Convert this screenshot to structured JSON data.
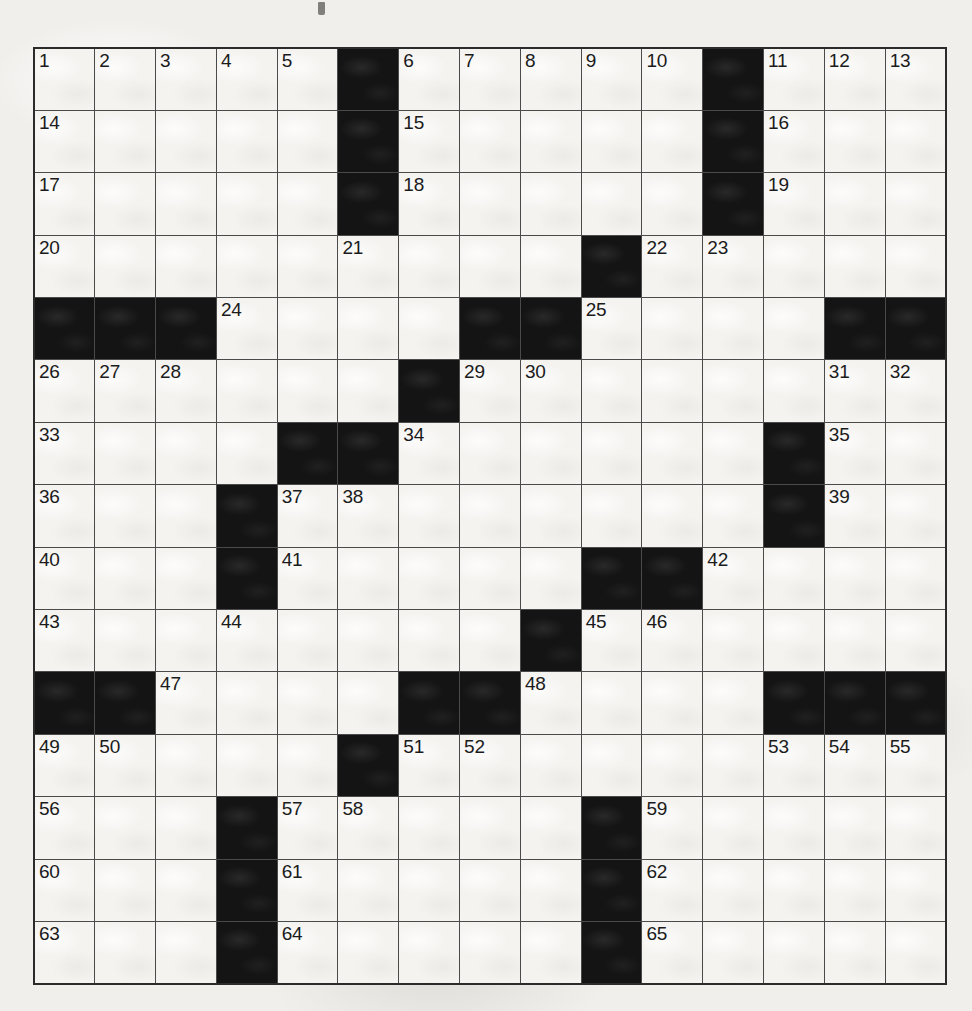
{
  "puzzle": {
    "name": "crossword-grid",
    "rows": 15,
    "columns": 15,
    "colors": {
      "block": "#141414",
      "cell": "#f4f3f0",
      "gridline": "#4a4a4a",
      "border": "#2b2b2b",
      "number_text": "#1b1b1b",
      "paper": "#f0efec"
    },
    "numbers_present": [
      "1",
      "2",
      "3",
      "4",
      "5",
      "6",
      "7",
      "8",
      "9",
      "10",
      "11",
      "12",
      "13",
      "14",
      "15",
      "16",
      "17",
      "18",
      "19",
      "20",
      "21",
      "22",
      "23",
      "24",
      "25",
      "26",
      "27",
      "28",
      "29",
      "30",
      "31",
      "32",
      "33",
      "34",
      "35",
      "36",
      "37",
      "38",
      "39",
      "40",
      "41",
      "42",
      "43",
      "44",
      "45",
      "46",
      "47",
      "48",
      "49",
      "50",
      "51",
      "52",
      "53",
      "54",
      "55",
      "56",
      "57",
      "58",
      "59",
      "60",
      "61",
      "62",
      "63",
      "64",
      "65"
    ],
    "highest_number": 65,
    "grid": [
      [
        {
          "type": "white",
          "number": "1"
        },
        {
          "type": "white",
          "number": "2"
        },
        {
          "type": "white",
          "number": "3"
        },
        {
          "type": "white",
          "number": "4"
        },
        {
          "type": "white",
          "number": "5"
        },
        {
          "type": "black",
          "number": null
        },
        {
          "type": "white",
          "number": "6"
        },
        {
          "type": "white",
          "number": "7"
        },
        {
          "type": "white",
          "number": "8"
        },
        {
          "type": "white",
          "number": "9"
        },
        {
          "type": "white",
          "number": "10"
        },
        {
          "type": "black",
          "number": null
        },
        {
          "type": "white",
          "number": "11"
        },
        {
          "type": "white",
          "number": "12"
        },
        {
          "type": "white",
          "number": "13"
        }
      ],
      [
        {
          "type": "white",
          "number": "14"
        },
        {
          "type": "white",
          "number": null
        },
        {
          "type": "white",
          "number": null
        },
        {
          "type": "white",
          "number": null
        },
        {
          "type": "white",
          "number": null
        },
        {
          "type": "black",
          "number": null
        },
        {
          "type": "white",
          "number": "15"
        },
        {
          "type": "white",
          "number": null
        },
        {
          "type": "white",
          "number": null
        },
        {
          "type": "white",
          "number": null
        },
        {
          "type": "white",
          "number": null
        },
        {
          "type": "black",
          "number": null
        },
        {
          "type": "white",
          "number": "16"
        },
        {
          "type": "white",
          "number": null
        },
        {
          "type": "white",
          "number": null
        }
      ],
      [
        {
          "type": "white",
          "number": "17"
        },
        {
          "type": "white",
          "number": null
        },
        {
          "type": "white",
          "number": null
        },
        {
          "type": "white",
          "number": null
        },
        {
          "type": "white",
          "number": null
        },
        {
          "type": "black",
          "number": null
        },
        {
          "type": "white",
          "number": "18"
        },
        {
          "type": "white",
          "number": null
        },
        {
          "type": "white",
          "number": null
        },
        {
          "type": "white",
          "number": null
        },
        {
          "type": "white",
          "number": null
        },
        {
          "type": "black",
          "number": null
        },
        {
          "type": "white",
          "number": "19"
        },
        {
          "type": "white",
          "number": null
        },
        {
          "type": "white",
          "number": null
        }
      ],
      [
        {
          "type": "white",
          "number": "20"
        },
        {
          "type": "white",
          "number": null
        },
        {
          "type": "white",
          "number": null
        },
        {
          "type": "white",
          "number": null
        },
        {
          "type": "white",
          "number": null
        },
        {
          "type": "white",
          "number": "21"
        },
        {
          "type": "white",
          "number": null
        },
        {
          "type": "white",
          "number": null
        },
        {
          "type": "white",
          "number": null
        },
        {
          "type": "black",
          "number": null
        },
        {
          "type": "white",
          "number": "22"
        },
        {
          "type": "white",
          "number": "23"
        },
        {
          "type": "white",
          "number": null
        },
        {
          "type": "white",
          "number": null
        },
        {
          "type": "white",
          "number": null
        }
      ],
      [
        {
          "type": "black",
          "number": null
        },
        {
          "type": "black",
          "number": null
        },
        {
          "type": "black",
          "number": null
        },
        {
          "type": "white",
          "number": "24"
        },
        {
          "type": "white",
          "number": null
        },
        {
          "type": "white",
          "number": null
        },
        {
          "type": "white",
          "number": null
        },
        {
          "type": "black",
          "number": null
        },
        {
          "type": "black",
          "number": null
        },
        {
          "type": "white",
          "number": "25"
        },
        {
          "type": "white",
          "number": null
        },
        {
          "type": "white",
          "number": null
        },
        {
          "type": "white",
          "number": null
        },
        {
          "type": "black",
          "number": null
        },
        {
          "type": "black",
          "number": null
        }
      ],
      [
        {
          "type": "white",
          "number": "26"
        },
        {
          "type": "white",
          "number": "27"
        },
        {
          "type": "white",
          "number": "28"
        },
        {
          "type": "white",
          "number": null
        },
        {
          "type": "white",
          "number": null
        },
        {
          "type": "white",
          "number": null
        },
        {
          "type": "black",
          "number": null
        },
        {
          "type": "white",
          "number": "29"
        },
        {
          "type": "white",
          "number": "30"
        },
        {
          "type": "white",
          "number": null
        },
        {
          "type": "white",
          "number": null
        },
        {
          "type": "white",
          "number": null
        },
        {
          "type": "white",
          "number": null
        },
        {
          "type": "white",
          "number": "31"
        },
        {
          "type": "white",
          "number": "32"
        }
      ],
      [
        {
          "type": "white",
          "number": "33"
        },
        {
          "type": "white",
          "number": null
        },
        {
          "type": "white",
          "number": null
        },
        {
          "type": "white",
          "number": null
        },
        {
          "type": "black",
          "number": null
        },
        {
          "type": "black",
          "number": null
        },
        {
          "type": "white",
          "number": "34"
        },
        {
          "type": "white",
          "number": null
        },
        {
          "type": "white",
          "number": null
        },
        {
          "type": "white",
          "number": null
        },
        {
          "type": "white",
          "number": null
        },
        {
          "type": "white",
          "number": null
        },
        {
          "type": "black",
          "number": null
        },
        {
          "type": "white",
          "number": "35"
        },
        {
          "type": "white",
          "number": null
        }
      ],
      [
        {
          "type": "white",
          "number": "36"
        },
        {
          "type": "white",
          "number": null
        },
        {
          "type": "white",
          "number": null
        },
        {
          "type": "black",
          "number": null
        },
        {
          "type": "white",
          "number": "37"
        },
        {
          "type": "white",
          "number": "38"
        },
        {
          "type": "white",
          "number": null
        },
        {
          "type": "white",
          "number": null
        },
        {
          "type": "white",
          "number": null
        },
        {
          "type": "white",
          "number": null
        },
        {
          "type": "white",
          "number": null
        },
        {
          "type": "white",
          "number": null
        },
        {
          "type": "black",
          "number": null
        },
        {
          "type": "white",
          "number": "39"
        },
        {
          "type": "white",
          "number": null
        }
      ],
      [
        {
          "type": "white",
          "number": "40"
        },
        {
          "type": "white",
          "number": null
        },
        {
          "type": "white",
          "number": null
        },
        {
          "type": "black",
          "number": null
        },
        {
          "type": "white",
          "number": "41"
        },
        {
          "type": "white",
          "number": null
        },
        {
          "type": "white",
          "number": null
        },
        {
          "type": "white",
          "number": null
        },
        {
          "type": "white",
          "number": null
        },
        {
          "type": "black",
          "number": null
        },
        {
          "type": "black",
          "number": null
        },
        {
          "type": "white",
          "number": "42"
        },
        {
          "type": "white",
          "number": null
        },
        {
          "type": "white",
          "number": null
        },
        {
          "type": "white",
          "number": null
        }
      ],
      [
        {
          "type": "white",
          "number": "43"
        },
        {
          "type": "white",
          "number": null
        },
        {
          "type": "white",
          "number": null
        },
        {
          "type": "white",
          "number": "44"
        },
        {
          "type": "white",
          "number": null
        },
        {
          "type": "white",
          "number": null
        },
        {
          "type": "white",
          "number": null
        },
        {
          "type": "white",
          "number": null
        },
        {
          "type": "black",
          "number": null
        },
        {
          "type": "white",
          "number": "45"
        },
        {
          "type": "white",
          "number": "46"
        },
        {
          "type": "white",
          "number": null
        },
        {
          "type": "white",
          "number": null
        },
        {
          "type": "white",
          "number": null
        },
        {
          "type": "white",
          "number": null
        }
      ],
      [
        {
          "type": "black",
          "number": null
        },
        {
          "type": "black",
          "number": null
        },
        {
          "type": "white",
          "number": "47"
        },
        {
          "type": "white",
          "number": null
        },
        {
          "type": "white",
          "number": null
        },
        {
          "type": "white",
          "number": null
        },
        {
          "type": "black",
          "number": null
        },
        {
          "type": "black",
          "number": null
        },
        {
          "type": "white",
          "number": "48"
        },
        {
          "type": "white",
          "number": null
        },
        {
          "type": "white",
          "number": null
        },
        {
          "type": "white",
          "number": null
        },
        {
          "type": "black",
          "number": null
        },
        {
          "type": "black",
          "number": null
        },
        {
          "type": "black",
          "number": null
        }
      ],
      [
        {
          "type": "white",
          "number": "49"
        },
        {
          "type": "white",
          "number": "50"
        },
        {
          "type": "white",
          "number": null
        },
        {
          "type": "white",
          "number": null
        },
        {
          "type": "white",
          "number": null
        },
        {
          "type": "black",
          "number": null
        },
        {
          "type": "white",
          "number": "51"
        },
        {
          "type": "white",
          "number": "52"
        },
        {
          "type": "white",
          "number": null
        },
        {
          "type": "white",
          "number": null
        },
        {
          "type": "white",
          "number": null
        },
        {
          "type": "white",
          "number": null
        },
        {
          "type": "white",
          "number": "53"
        },
        {
          "type": "white",
          "number": "54"
        },
        {
          "type": "white",
          "number": "55"
        }
      ],
      [
        {
          "type": "white",
          "number": "56"
        },
        {
          "type": "white",
          "number": null
        },
        {
          "type": "white",
          "number": null
        },
        {
          "type": "black",
          "number": null
        },
        {
          "type": "white",
          "number": "57"
        },
        {
          "type": "white",
          "number": "58"
        },
        {
          "type": "white",
          "number": null
        },
        {
          "type": "white",
          "number": null
        },
        {
          "type": "white",
          "number": null
        },
        {
          "type": "black",
          "number": null
        },
        {
          "type": "white",
          "number": "59"
        },
        {
          "type": "white",
          "number": null
        },
        {
          "type": "white",
          "number": null
        },
        {
          "type": "white",
          "number": null
        },
        {
          "type": "white",
          "number": null
        }
      ],
      [
        {
          "type": "white",
          "number": "60"
        },
        {
          "type": "white",
          "number": null
        },
        {
          "type": "white",
          "number": null
        },
        {
          "type": "black",
          "number": null
        },
        {
          "type": "white",
          "number": "61"
        },
        {
          "type": "white",
          "number": null
        },
        {
          "type": "white",
          "number": null
        },
        {
          "type": "white",
          "number": null
        },
        {
          "type": "white",
          "number": null
        },
        {
          "type": "black",
          "number": null
        },
        {
          "type": "white",
          "number": "62"
        },
        {
          "type": "white",
          "number": null
        },
        {
          "type": "white",
          "number": null
        },
        {
          "type": "white",
          "number": null
        },
        {
          "type": "white",
          "number": null
        }
      ],
      [
        {
          "type": "white",
          "number": "63"
        },
        {
          "type": "white",
          "number": null
        },
        {
          "type": "white",
          "number": null
        },
        {
          "type": "black",
          "number": null
        },
        {
          "type": "white",
          "number": "64"
        },
        {
          "type": "white",
          "number": null
        },
        {
          "type": "white",
          "number": null
        },
        {
          "type": "white",
          "number": null
        },
        {
          "type": "white",
          "number": null
        },
        {
          "type": "black",
          "number": null
        },
        {
          "type": "white",
          "number": "65"
        },
        {
          "type": "white",
          "number": null
        },
        {
          "type": "white",
          "number": null
        },
        {
          "type": "white",
          "number": null
        },
        {
          "type": "white",
          "number": null
        }
      ]
    ]
  }
}
